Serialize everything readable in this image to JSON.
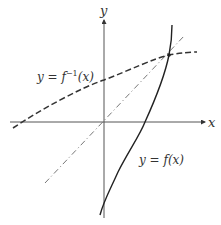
{
  "diagram": {
    "axes": {
      "x_label": "x",
      "y_label": "y"
    },
    "curves": [
      {
        "id": "f",
        "label": "y = f(x)",
        "style": "solid"
      },
      {
        "id": "f_inverse",
        "label": "y = f⁻¹(x)",
        "style": "dashed"
      },
      {
        "id": "identity",
        "label": "y = x",
        "style": "dash-dot"
      }
    ],
    "labels": {
      "f": "y = f(x)",
      "f_inverse_prefix": "y = f",
      "f_inverse_sup": "−1",
      "f_inverse_suffix": "(x)"
    },
    "colors": {
      "ink": "#333333",
      "light_ink": "#666666"
    }
  }
}
